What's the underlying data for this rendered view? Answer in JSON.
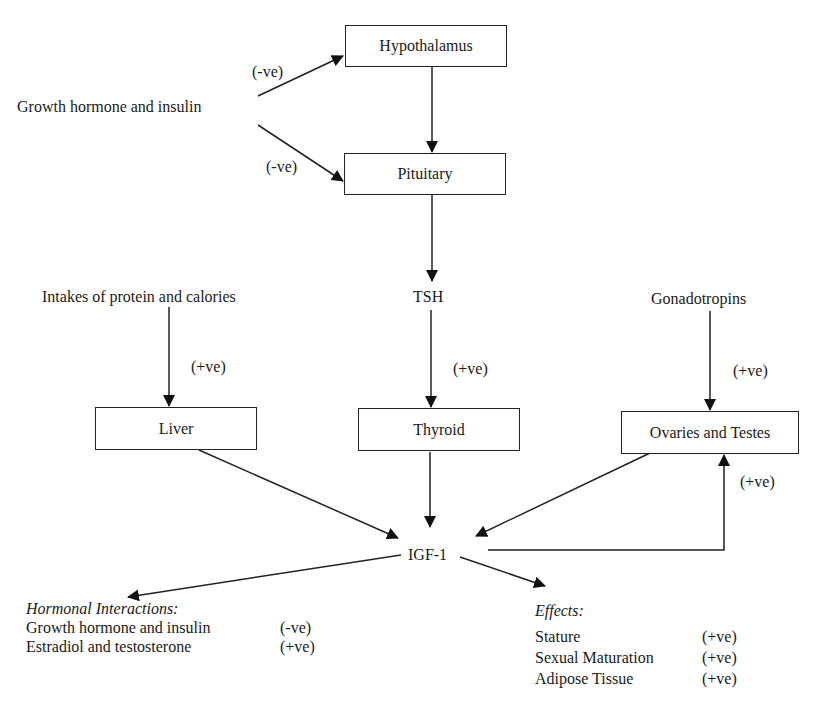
{
  "nodes": {
    "hypothalamus": "Hypothalamus",
    "pituitary": "Pituitary",
    "liver": "Liver",
    "thyroid": "Thyroid",
    "gonads": "Ovaries and Testes"
  },
  "labels": {
    "gh_insulin": "Growth hormone and insulin",
    "intakes": "Intakes of protein and calories",
    "tsh": "TSH",
    "gonadotropins": "Gonadotropins",
    "igf1": "IGF-1"
  },
  "edge_signs": {
    "gh_to_hypothalamus": "(-ve)",
    "gh_to_pituitary": "(-ve)",
    "intakes_to_liver": "(+ve)",
    "tsh_to_thyroid": "(+ve)",
    "gonadotropins_to_gonads": "(+ve)",
    "igf1_to_gonads": "(+ve)"
  },
  "hormonal_interactions": {
    "title": "Hormonal Interactions:",
    "items": [
      {
        "name": "Growth hormone and insulin",
        "sign": "(-ve)"
      },
      {
        "name": "Estradiol and testosterone",
        "sign": "(+ve)"
      }
    ]
  },
  "effects": {
    "title": "Effects:",
    "items": [
      {
        "name": "Stature",
        "sign": "(+ve)"
      },
      {
        "name": "Sexual Maturation",
        "sign": "(+ve)"
      },
      {
        "name": "Adipose Tissue",
        "sign": "(+ve)"
      }
    ]
  }
}
